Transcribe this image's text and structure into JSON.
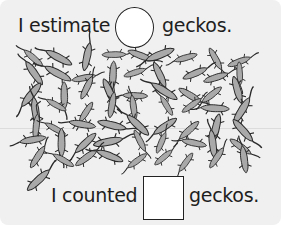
{
  "worksheet": {
    "estimate_prefix": "I estimate",
    "estimate_suffix": "geckos.",
    "estimate_answer": "",
    "count_prefix": "I counted",
    "count_suffix": "geckos.",
    "count_answer": ""
  },
  "illustration": {
    "subject": "gecko",
    "description": "swarm of hand-drawn geckos to estimate and count"
  },
  "colors": {
    "background": "#f0f0f0",
    "text": "#1e1e1e",
    "gecko_fill": "#a9a9a9",
    "gecko_outline": "#2a2a2a"
  }
}
